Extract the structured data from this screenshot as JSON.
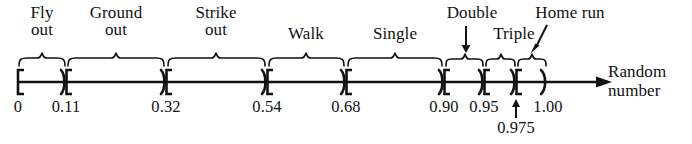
{
  "figure": {
    "axis": {
      "label_line1": "Random",
      "label_line2": "number",
      "start_value": "0",
      "end_value": "1.00",
      "start_bracket": "[",
      "end_bracket": ")"
    },
    "tick_labels": [
      {
        "text": "0",
        "value": 0.0,
        "x": 18
      },
      {
        "text": "0.11",
        "value": 0.11,
        "x": 66
      },
      {
        "text": "0.32",
        "value": 0.32,
        "x": 166
      },
      {
        "text": "0.54",
        "value": 0.54,
        "x": 267
      },
      {
        "text": "0.68",
        "value": 0.68,
        "x": 346
      },
      {
        "text": "0.90",
        "value": 0.9,
        "x": 444
      },
      {
        "text": "0.95",
        "value": 0.95,
        "x": 484
      },
      {
        "text": "1.00",
        "value": 1.0,
        "x": 546
      },
      {
        "text": "0.975",
        "value": 0.975,
        "x": 516
      }
    ],
    "categories": [
      {
        "name": "Fly out",
        "line1": "Fly",
        "line2": "out",
        "from": 0.0,
        "to": 0.11,
        "x_from": 18,
        "x_to": 66,
        "label_x": 42,
        "two_line": true,
        "callout": "brace"
      },
      {
        "name": "Ground out",
        "line1": "Ground",
        "line2": "out",
        "from": 0.11,
        "to": 0.32,
        "x_from": 66,
        "x_to": 166,
        "label_x": 116,
        "two_line": true,
        "callout": "brace"
      },
      {
        "name": "Strike out",
        "line1": "Strike",
        "line2": "out",
        "from": 0.32,
        "to": 0.54,
        "x_from": 166,
        "x_to": 267,
        "label_x": 216,
        "two_line": true,
        "callout": "brace"
      },
      {
        "name": "Walk",
        "line1": "Walk",
        "line2": "",
        "from": 0.54,
        "to": 0.68,
        "x_from": 267,
        "x_to": 346,
        "label_x": 306,
        "two_line": false,
        "callout": "brace"
      },
      {
        "name": "Single",
        "line1": "Single",
        "line2": "",
        "from": 0.68,
        "to": 0.9,
        "x_from": 346,
        "x_to": 444,
        "label_x": 395,
        "two_line": false,
        "callout": "brace"
      },
      {
        "name": "Double",
        "line1": "Double",
        "line2": "",
        "from": 0.9,
        "to": 0.95,
        "x_from": 444,
        "x_to": 484,
        "label_x": 466,
        "two_line": false,
        "callout": "arrow-down"
      },
      {
        "name": "Triple",
        "line1": "Triple",
        "line2": "",
        "from": 0.95,
        "to": 0.975,
        "x_from": 484,
        "x_to": 516,
        "label_x": 511,
        "two_line": false,
        "callout": "brace"
      },
      {
        "name": "Home run",
        "line1": "Home run",
        "line2": "",
        "from": 0.975,
        "to": 1.0,
        "x_from": 516,
        "x_to": 546,
        "label_x": 565,
        "two_line": false,
        "callout": "arrow-diagonal"
      }
    ],
    "colors": {
      "ink": "#111111",
      "background": "#ffffff"
    }
  }
}
